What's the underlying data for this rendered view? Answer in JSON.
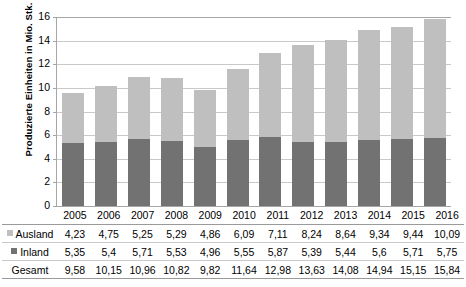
{
  "chart_data": {
    "type": "bar",
    "subtype": "stacked-column",
    "title": "",
    "xlabel": "",
    "ylabel": "Produzierte Einheiten in Mio. Stk.",
    "ylim": [
      0,
      16
    ],
    "ytick_step": 2,
    "yticks": [
      "16",
      "14",
      "12",
      "10",
      "8",
      "6",
      "4",
      "2",
      "0"
    ],
    "grid": true,
    "legend_position": "table-row-headers",
    "categories": [
      "2005",
      "2006",
      "2007",
      "2008",
      "2009",
      "2010",
      "2011",
      "2012",
      "2013",
      "2014",
      "2015",
      "2016"
    ],
    "series": [
      {
        "name": "Ausland",
        "color": "#bfbfbf",
        "values": [
          4.23,
          4.75,
          5.25,
          5.29,
          4.86,
          6.09,
          7.11,
          8.24,
          8.64,
          9.34,
          9.44,
          10.09
        ],
        "labels": [
          "4,23",
          "4,75",
          "5,25",
          "5,29",
          "4,86",
          "6,09",
          "7,11",
          "8,24",
          "8,64",
          "9,34",
          "9,44",
          "10,09"
        ]
      },
      {
        "name": "Inland",
        "color": "#727272",
        "values": [
          5.35,
          5.4,
          5.71,
          5.53,
          4.96,
          5.55,
          5.87,
          5.39,
          5.44,
          5.6,
          5.71,
          5.75
        ],
        "labels": [
          "5,35",
          "5,4",
          "5,71",
          "5,53",
          "4,96",
          "5,55",
          "5,87",
          "5,39",
          "5,44",
          "5,6",
          "5,71",
          "5,75"
        ]
      }
    ],
    "totals": {
      "name": "Gesamt",
      "values": [
        9.58,
        10.15,
        10.96,
        10.82,
        9.82,
        11.64,
        12.98,
        13.63,
        14.08,
        14.94,
        15.15,
        15.84
      ],
      "labels": [
        "9,58",
        "10,15",
        "10,96",
        "10,82",
        "9,82",
        "11,64",
        "12,98",
        "13,63",
        "14,08",
        "14,94",
        "15,15",
        "15,84"
      ]
    },
    "stack_order": [
      "Inland",
      "Ausland"
    ]
  },
  "axis": {
    "y_title": "Produzierte Einheiten in Mio. Stk."
  },
  "table": {
    "row_headers": [
      "Ausland",
      "Inland",
      "Gesamt"
    ],
    "years_header_blank": ""
  },
  "colors": {
    "ausland": "#bfbfbf",
    "inland": "#727272",
    "gridline": "#c9c9c9",
    "axis": "#a6a6a6",
    "text": "#000000",
    "background": "#ffffff"
  }
}
